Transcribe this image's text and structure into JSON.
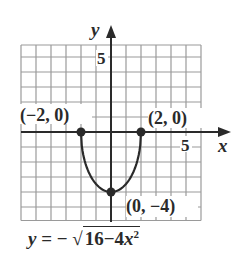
{
  "chart_data": {
    "type": "line",
    "title": "",
    "equation": "y = -sqrt(16 - 4x^2)",
    "xlabel": "x",
    "ylabel": "y",
    "xlim": [
      -6,
      6
    ],
    "ylim": [
      -6,
      6
    ],
    "grid": true,
    "tick_labels": {
      "x": [
        "5"
      ],
      "y": [
        "5"
      ]
    },
    "series": [
      {
        "name": "y = -sqrt(16 - 4x^2)",
        "x": [
          -2,
          -1.75,
          -1.5,
          -1,
          -0.5,
          0,
          0.5,
          1,
          1.5,
          1.75,
          2
        ],
        "y": [
          0,
          -1.94,
          -2.65,
          -3.46,
          -3.87,
          -4,
          -3.87,
          -3.46,
          -2.65,
          -1.94,
          0
        ]
      }
    ],
    "points": [
      {
        "x": -2,
        "y": 0,
        "label": "(−2, 0)"
      },
      {
        "x": 2,
        "y": 0,
        "label": "(2, 0)"
      },
      {
        "x": 0,
        "y": -4,
        "label": "(0, −4)"
      }
    ]
  },
  "labels": {
    "x_axis": "x",
    "y_axis": "y",
    "x_tick": "5",
    "y_tick": "5",
    "point_left": "(−2, 0)",
    "point_right": "(2, 0)",
    "point_bottom": "(0, −4)"
  },
  "formula": {
    "lhs": "y",
    "eq": " = − ",
    "radicand_a": "16−4",
    "radicand_var": "x",
    "radicand_exp": "2"
  },
  "colors": {
    "curve": "#2a2a2a",
    "grid": "#9a9a9a",
    "axis": "#2a2a2a"
  }
}
